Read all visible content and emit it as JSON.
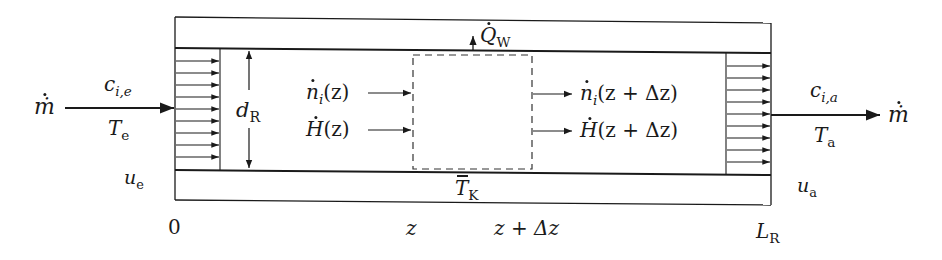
{
  "diagram": {
    "type": "tubular reactor differential balance schematic",
    "inlet": {
      "mass_flow": "ṁ",
      "concentration": {
        "base": "c",
        "sub": "i,e"
      },
      "temperature": {
        "base": "T",
        "sub": "e"
      },
      "velocity": {
        "base": "u",
        "sub": "e"
      }
    },
    "outlet": {
      "mass_flow": "ṁ",
      "concentration": {
        "base": "c",
        "sub": "i,a"
      },
      "temperature": {
        "base": "T",
        "sub": "a"
      },
      "velocity": {
        "base": "u",
        "sub": "a"
      }
    },
    "reactor": {
      "diameter": {
        "base": "d",
        "sub": "R"
      },
      "length": {
        "base": "L",
        "sub": "R"
      },
      "heat_flux": {
        "base": "Q",
        "sub": "W"
      },
      "coolant_temperature": {
        "base": "T",
        "sub": "K"
      }
    },
    "control_volume": {
      "in_species": {
        "base": "n",
        "sub": "i",
        "arg": "(z)"
      },
      "in_enthalpy": {
        "base": "H",
        "arg": "(z)"
      },
      "out_species": {
        "base": "n",
        "sub": "i",
        "arg": "(z + Δz)"
      },
      "out_enthalpy": {
        "base": "H",
        "arg": "(z + Δz)"
      }
    },
    "axis": {
      "start": "0",
      "z": "z",
      "z_plus_dz": "z + Δz"
    },
    "flow_profile_arrows_per_side": 9
  }
}
